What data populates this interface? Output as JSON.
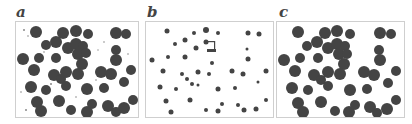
{
  "figure": {
    "panels": [
      {
        "label": "a",
        "description": "dense large dark particles with small debris"
      },
      {
        "label": "b",
        "description": "sparse small dark particles"
      },
      {
        "label": "c",
        "description": "dense large dark particles, cleaned"
      }
    ],
    "colors": {
      "particle": "#404040",
      "border": "#cfcfcf",
      "background": "#ffffff"
    }
  }
}
